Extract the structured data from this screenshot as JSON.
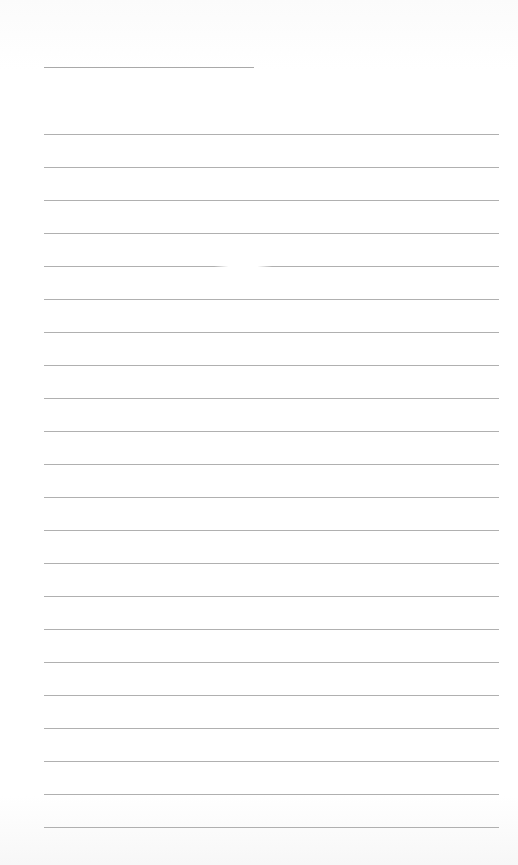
{
  "document": {
    "type": "lined-paper",
    "header_line": {
      "left": 44,
      "top": 67,
      "width": 210
    },
    "ruled_lines": {
      "count": 22,
      "first_top": 134,
      "spacing": 33,
      "left": 44,
      "width": 455
    },
    "glare_gap": {
      "line_index": 4,
      "left": 214,
      "width": 58
    },
    "colors": {
      "background": "#ffffff",
      "line": "#b0b0b0"
    }
  }
}
